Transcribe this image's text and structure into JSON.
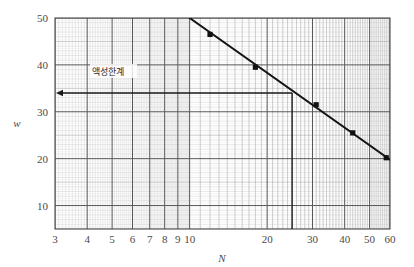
{
  "chart_data": {
    "type": "line",
    "title": "",
    "subtitle": "",
    "xlabel": "N",
    "ylabel": "w",
    "xscale": "log",
    "yscale": "linear",
    "xlim": [
      3,
      60
    ],
    "ylim": [
      5,
      50
    ],
    "grid": "log-log graph paper, minor grid on",
    "legend_position": "none",
    "series": [
      {
        "name": "flow-curve",
        "x": [
          12,
          18,
          31,
          43,
          58
        ],
        "y": [
          46.5,
          39.5,
          31.5,
          25.5,
          20.2
        ],
        "line_x": [
          10,
          60
        ],
        "line_y": [
          50,
          19.8
        ],
        "marker": "filled-square"
      }
    ],
    "x_ticks": [
      3,
      4,
      5,
      6,
      7,
      8,
      9,
      10,
      20,
      30,
      40,
      50,
      60
    ],
    "x_tick_labels": [
      "3",
      "4",
      "5",
      "6",
      "7",
      "8",
      "9",
      "10",
      "20",
      "30",
      "40",
      "50",
      "60"
    ],
    "y_ticks": [
      10,
      20,
      30,
      40,
      50
    ],
    "y_tick_labels": [
      "10",
      "20",
      "30",
      "40",
      "50"
    ],
    "annotations": [
      {
        "name": "liquid-limit",
        "text": "액성한계",
        "value_w": 34,
        "value_N": 25,
        "style": "horizontal line with left arrow from N=25 to y-axis at w=34, plus vertical drop line at N=25"
      }
    ],
    "colors": {
      "line": "#1a1a1a",
      "marker": "#111111",
      "grid_major": "#555555",
      "grid_minor": "#a8a8a8",
      "text": "#4a4a4a",
      "background": "#ffffff"
    }
  },
  "axes": {
    "x_title": "N",
    "y_title": "w"
  },
  "annotation": {
    "liquid_limit_label": "액성한계"
  },
  "ticks": {
    "x": [
      "3",
      "4",
      "5",
      "6",
      "7",
      "8",
      "9",
      "10",
      "20",
      "30",
      "40",
      "50",
      "60"
    ],
    "y": [
      "10",
      "20",
      "30",
      "40",
      "50"
    ]
  }
}
